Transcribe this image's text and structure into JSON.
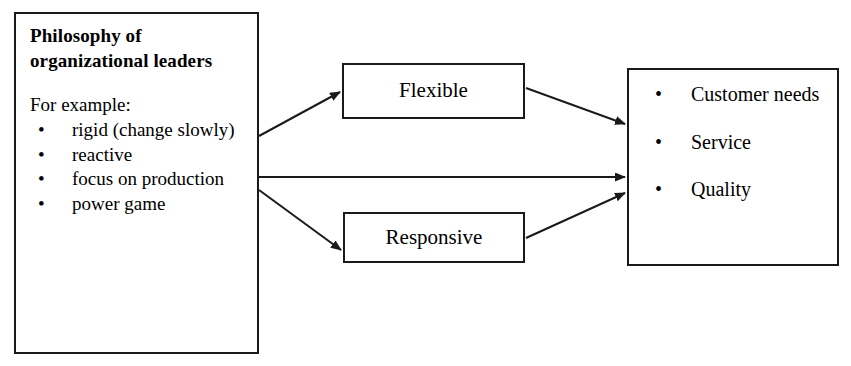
{
  "diagram": {
    "philosophy_box": {
      "heading": "Philosophy of organizational leaders",
      "intro": "For example:",
      "bullet_glyph": "•",
      "items": [
        "rigid (change slowly)",
        "reactive",
        "focus on production",
        "power game"
      ]
    },
    "middle_boxes": [
      {
        "label": "Flexible"
      },
      {
        "label": "Responsive"
      }
    ],
    "outcomes_box": {
      "bullet_glyph": "•",
      "items": [
        "Customer needs",
        "Service",
        "Quality"
      ]
    },
    "connectors": [
      {
        "from": "philosophy",
        "to": "flexible"
      },
      {
        "from": "philosophy",
        "to": "outcomes"
      },
      {
        "from": "philosophy",
        "to": "responsive"
      },
      {
        "from": "flexible",
        "to": "outcomes"
      },
      {
        "from": "responsive",
        "to": "outcomes"
      }
    ],
    "colors": {
      "stroke": "#1a1a1a",
      "background": "#ffffff",
      "text": "#000000"
    }
  }
}
